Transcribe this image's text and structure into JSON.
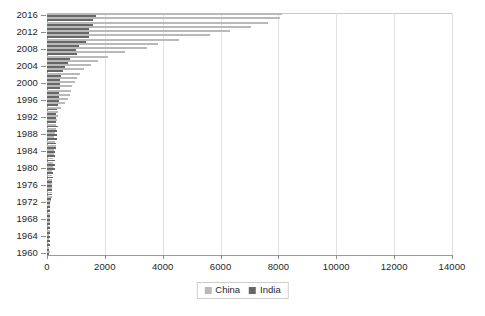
{
  "chart_data": {
    "type": "bar",
    "orientation": "horizontal",
    "title": "",
    "xlabel": "",
    "ylabel": "",
    "xlim": [
      0,
      14000
    ],
    "ylim_categories": [
      "1960",
      "2016"
    ],
    "grid": true,
    "legend_position": "bottom-center",
    "x_ticks": [
      0,
      2000,
      4000,
      6000,
      8000,
      10000,
      12000,
      14000
    ],
    "x_tick_labels": [
      "0",
      "2000",
      "4000",
      "6000",
      "8000",
      "10000",
      "12000",
      "14000"
    ],
    "y_tick_labels": [
      "2016",
      "2012",
      "2008",
      "2004",
      "2000",
      "1996",
      "1992",
      "1988",
      "1984",
      "1980",
      "1976",
      "1972",
      "1968",
      "1964",
      "1960"
    ],
    "categories": [
      "1960",
      "1961",
      "1962",
      "1963",
      "1964",
      "1965",
      "1966",
      "1967",
      "1968",
      "1969",
      "1970",
      "1971",
      "1972",
      "1973",
      "1974",
      "1975",
      "1976",
      "1977",
      "1978",
      "1979",
      "1980",
      "1981",
      "1982",
      "1983",
      "1984",
      "1985",
      "1986",
      "1987",
      "1988",
      "1989",
      "1990",
      "1991",
      "1992",
      "1993",
      "1994",
      "1995",
      "1996",
      "1997",
      "1998",
      "1999",
      "2000",
      "2001",
      "2002",
      "2003",
      "2004",
      "2005",
      "2006",
      "2007",
      "2008",
      "2009",
      "2010",
      "2011",
      "2012",
      "2013",
      "2014",
      "2015",
      "2016"
    ],
    "series": [
      {
        "name": "China",
        "color": "#b9b9b9",
        "values": [
          90,
          76,
          71,
          74,
          85,
          98,
          104,
          96,
          92,
          100,
          113,
          119,
          131,
          157,
          160,
          178,
          165,
          185,
          156,
          184,
          195,
          197,
          203,
          225,
          250,
          294,
          282,
          251,
          283,
          310,
          318,
          333,
          366,
          377,
          473,
          609,
          709,
          781,
          828,
          873,
          959,
          1053,
          1148,
          1288,
          1508,
          1753,
          2099,
          2693,
          3468,
          3832,
          4550,
          5618,
          6317,
          7051,
          7651,
          8069,
          8123
        ]
      },
      {
        "name": "India",
        "color": "#676767",
        "values": [
          82,
          85,
          90,
          101,
          115,
          119,
          90,
          96,
          100,
          107,
          112,
          118,
          119,
          143,
          163,
          158,
          161,
          186,
          205,
          224,
          267,
          270,
          274,
          291,
          277,
          300,
          311,
          340,
          355,
          346,
          368,
          303,
          317,
          301,
          346,
          374,
          400,
          415,
          413,
          442,
          443,
          451,
          470,
          545,
          627,
          715,
          806,
          1024,
          991,
          1090,
          1341,
          1461,
          1446,
          1450,
          1574,
          1606,
          1710
        ]
      }
    ]
  },
  "legend": {
    "items": [
      {
        "label": "China",
        "color": "#b9b9b9"
      },
      {
        "label": "India",
        "color": "#676767"
      }
    ]
  }
}
